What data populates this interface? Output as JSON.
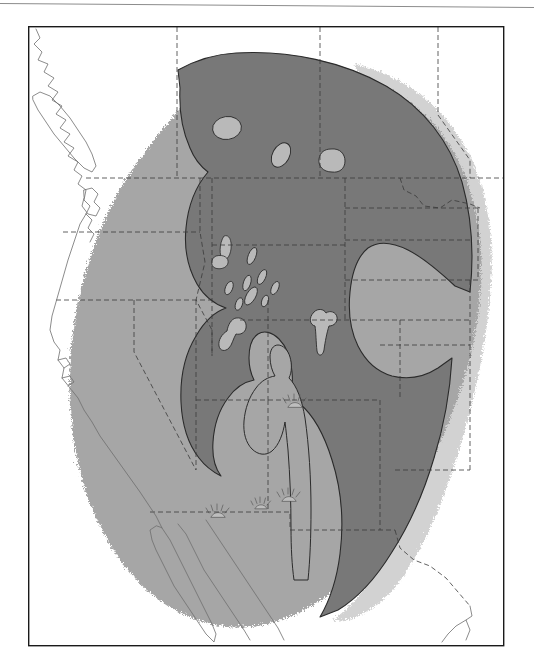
{
  "page": {
    "background_color": "#ffffff",
    "width": 534,
    "height": 671
  },
  "top_rule": {
    "name": "horizontal-rule",
    "color": "#8c8c8c",
    "thickness": 1
  },
  "figure": {
    "type": "thematic-map",
    "region": "Western United States",
    "frame": {
      "left": 28,
      "top": 26,
      "right": 503,
      "bottom": 645,
      "stroke_color": "#1a1a1a",
      "stroke_width": 1.4,
      "fill": "#ffffff"
    },
    "legend_colors": {
      "outer_zone": "#a6a6a6",
      "inner_zone": "#787878",
      "eastern_lobe": "#d2d2d2",
      "enclosed_uplift": "#b9b9b9",
      "background_land": "#ffffff"
    },
    "line_styles": {
      "coastline_color": "#6e6e6e",
      "coastline_width": 0.8,
      "state_boundary_color": "#3a3a3a",
      "state_boundary_width": 0.8,
      "state_boundary_dash": "5,3",
      "zone_outline_color": "#2b2b2b",
      "zone_outline_width": 1.1
    },
    "zones": [
      {
        "id": "outer-zone",
        "label": "outer shaded zone",
        "fill": "#a6a6a6",
        "edge": "scalloped"
      },
      {
        "id": "inner-zone",
        "label": "inner shaded zone",
        "fill": "#787878",
        "edge": "smooth"
      },
      {
        "id": "eastern-lobe",
        "label": "eastern light lobe",
        "fill": "#d2d2d2",
        "edge": "scalloped"
      }
    ],
    "enclosed_uplifts": [
      {
        "id": "uplift-1",
        "cx": 227,
        "cy": 128,
        "rx": 14,
        "ry": 11,
        "rot": -8
      },
      {
        "id": "uplift-2",
        "cx": 281,
        "cy": 155,
        "rx": 9,
        "ry": 13,
        "rot": 28
      },
      {
        "id": "uplift-3",
        "cx": 331,
        "cy": 160,
        "rx": 13,
        "ry": 11,
        "rot": 12
      },
      {
        "id": "uplift-4",
        "cx": 227,
        "cy": 245,
        "rx": 6,
        "ry": 10,
        "rot": 18
      },
      {
        "id": "uplift-5",
        "cx": 221,
        "cy": 262,
        "rx": 8,
        "ry": 6,
        "rot": -20
      },
      {
        "id": "uplift-6",
        "cx": 251,
        "cy": 255,
        "rx": 4,
        "ry": 9,
        "rot": 22
      },
      {
        "id": "uplift-7",
        "cx": 246,
        "cy": 282,
        "rx": 4,
        "ry": 8,
        "rot": 20
      },
      {
        "id": "uplift-8",
        "cx": 229,
        "cy": 288,
        "rx": 4,
        "ry": 7,
        "rot": 20
      },
      {
        "id": "uplift-9",
        "cx": 261,
        "cy": 277,
        "rx": 4,
        "ry": 8,
        "rot": 25
      },
      {
        "id": "uplift-10",
        "cx": 274,
        "cy": 287,
        "rx": 4,
        "ry": 7,
        "rot": 25
      },
      {
        "id": "uplift-11",
        "cx": 250,
        "cy": 295,
        "rx": 6,
        "ry": 9,
        "rot": 30
      },
      {
        "id": "uplift-12",
        "cx": 239,
        "cy": 303,
        "rx": 4,
        "ry": 6,
        "rot": 20
      },
      {
        "id": "uplift-13",
        "cx": 264,
        "cy": 300,
        "rx": 3,
        "ry": 6,
        "rot": 20
      },
      {
        "id": "uplift-14",
        "cx": 234,
        "cy": 330,
        "rx": 9,
        "ry": 12,
        "rot": 8
      },
      {
        "id": "uplift-15",
        "cx": 320,
        "cy": 320,
        "rx": 8,
        "ry": 12,
        "rot": 0
      }
    ],
    "volcanic_symbols": [
      {
        "id": "volcanic-field-1",
        "x": 295,
        "y": 404
      },
      {
        "id": "volcanic-field-2",
        "x": 289,
        "y": 498
      },
      {
        "id": "volcanic-field-3",
        "x": 261,
        "y": 506
      },
      {
        "id": "volcanic-field-4",
        "x": 218,
        "y": 514
      }
    ]
  }
}
